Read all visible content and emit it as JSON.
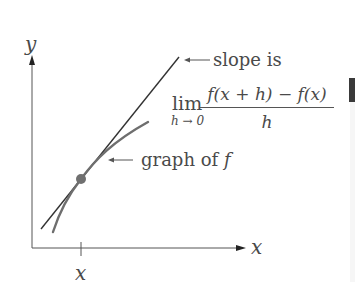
{
  "diagram": {
    "axes": {
      "y_label": "y",
      "x_label": "x",
      "tick_label": "x"
    },
    "annotations": {
      "slope_label": "slope is",
      "limit_word": "lim",
      "limit_subscript": "h → 0",
      "numerator": "f(x + h) − f(x)",
      "denominator": "h",
      "graph_label": "graph of ",
      "graph_label_fn": "f"
    },
    "elements": [
      "tangent-line",
      "graph-of-f-curve",
      "point-of-tangency"
    ],
    "colors": {
      "axis": "#555555",
      "tangent": "#333333",
      "curve": "#6e6e6e",
      "point": "#707070",
      "text": "#4a4a4a"
    }
  }
}
